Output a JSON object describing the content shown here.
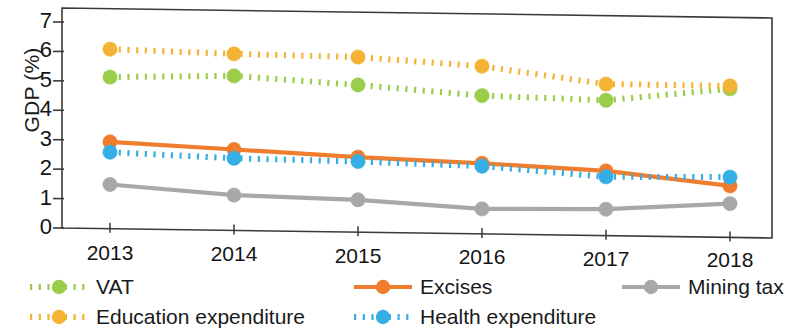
{
  "chart_data": {
    "type": "line",
    "title": "",
    "xlabel": "",
    "ylabel": "GDP (%)",
    "categories": [
      "2013",
      "2014",
      "2015",
      "2016",
      "2017",
      "2018"
    ],
    "x_tick_labels": [
      "2013",
      "2014",
      "2015",
      "2016",
      "2017",
      "2018"
    ],
    "y_tick_labels": [
      "0",
      "1",
      "2",
      "3",
      "4",
      "5",
      "6",
      "7"
    ],
    "ylim": [
      0,
      7
    ],
    "y_tick_step": 1,
    "grid": false,
    "legend_position": "bottom",
    "series": [
      {
        "name": "VAT",
        "color": "#9ACD4A",
        "style": "dotted",
        "marker": "circle",
        "values": [
          5.15,
          5.25,
          5.0,
          4.7,
          4.6,
          5.05
        ]
      },
      {
        "name": "Education expenditure",
        "color": "#F5B335",
        "style": "dotted",
        "marker": "circle",
        "values": [
          6.1,
          6.0,
          5.95,
          5.7,
          5.15,
          5.15
        ]
      },
      {
        "name": "Excises",
        "color": "#F07D2E",
        "style": "solid",
        "marker": "circle",
        "values": [
          2.95,
          2.75,
          2.55,
          2.4,
          2.2,
          1.75
        ]
      },
      {
        "name": "Health expenditure",
        "color": "#34AEE5",
        "style": "dotted",
        "marker": "circle",
        "values": [
          2.6,
          2.45,
          2.4,
          2.3,
          2.0,
          2.05
        ]
      },
      {
        "name": "Mining tax",
        "color": "#A8A8A8",
        "style": "solid",
        "marker": "circle",
        "values": [
          1.5,
          1.2,
          1.1,
          0.85,
          0.9,
          1.15
        ]
      }
    ]
  },
  "legend": {
    "entries": [
      {
        "label": "VAT",
        "color": "#9ACD4A",
        "style": "dotted"
      },
      {
        "label": "Education expenditure",
        "color": "#F5B335",
        "style": "dotted"
      },
      {
        "label": "Excises",
        "color": "#F07D2E",
        "style": "solid"
      },
      {
        "label": "Health expenditure",
        "color": "#34AEE5",
        "style": "dotted"
      },
      {
        "label": "Mining tax",
        "color": "#A8A8A8",
        "style": "solid"
      }
    ]
  },
  "axis": {
    "frame_color": "#3a3a3a"
  }
}
